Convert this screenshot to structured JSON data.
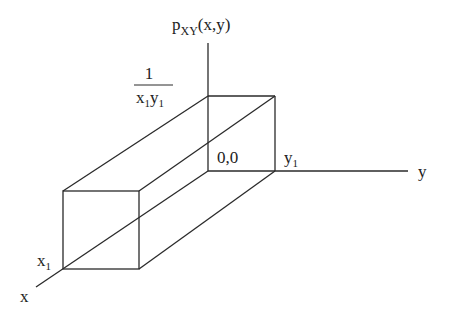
{
  "diagram": {
    "axis_labels": {
      "z_axis": {
        "base": "p",
        "sub": "XY",
        "args": "(x,y)"
      },
      "y_axis": "y",
      "x_axis": "x"
    },
    "height_label": {
      "numerator": "1",
      "den_x": "x",
      "den_x_sub": "1",
      "den_y": "y",
      "den_y_sub": "1"
    },
    "origin_label": "0,0",
    "y1_label": {
      "base": "y",
      "sub": "1"
    },
    "x1_label": {
      "base": "x",
      "sub": "1"
    },
    "colors": {
      "line": "#2a2a2a",
      "text": "#222222",
      "background": "#ffffff"
    }
  }
}
